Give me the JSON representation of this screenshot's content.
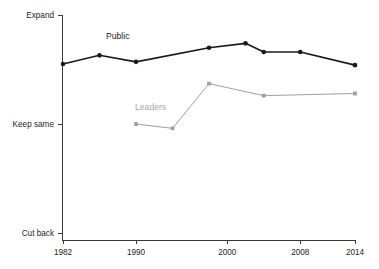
{
  "chart_data": {
    "type": "line",
    "title": "",
    "subtitle": "",
    "xlabel": "",
    "ylabel": "",
    "x_ticks": [
      1982,
      1990,
      2000,
      2008,
      2014
    ],
    "x_tick_labels": [
      "1982",
      "1990",
      "2000",
      "2008",
      "2014"
    ],
    "xlim": [
      1981,
      2015
    ],
    "y_ticks": [
      0,
      1,
      2
    ],
    "y_tick_labels": [
      "Cut back",
      "Keep same",
      "Expand"
    ],
    "ylim": [
      0,
      2
    ],
    "grid": false,
    "legend": "inline-labels",
    "series": [
      {
        "name": "Public",
        "color": "#1a1a1a",
        "label_color": "#1a1a1a",
        "label_x": 1988.0,
        "label_y": 1.78,
        "x": [
          1982,
          1986,
          1990,
          1998,
          2002,
          2004,
          2008,
          2014
        ],
        "y": [
          1.55,
          1.63,
          1.57,
          1.7,
          1.74,
          1.66,
          1.66,
          1.54
        ],
        "points": [
          {
            "x": 1982,
            "y": 1.55
          },
          {
            "x": 1986,
            "y": 1.63
          },
          {
            "x": 1990,
            "y": 1.57
          },
          {
            "x": 1998,
            "y": 1.7
          },
          {
            "x": 2002,
            "y": 1.74
          },
          {
            "x": 2004,
            "y": 1.66
          },
          {
            "x": 2008,
            "y": 1.66
          },
          {
            "x": 2014,
            "y": 1.54
          }
        ]
      },
      {
        "name": "Leaders",
        "color": "#a0a0a0",
        "label_color": "#a8a8a8",
        "label_x": 1991.6,
        "label_y": 1.13,
        "x": [
          1990,
          1994,
          1998,
          2004,
          2014
        ],
        "y": [
          1.0,
          0.96,
          1.37,
          1.26,
          1.28
        ],
        "points": [
          {
            "x": 1990,
            "y": 1.0
          },
          {
            "x": 1994,
            "y": 0.96
          },
          {
            "x": 1998,
            "y": 1.37
          },
          {
            "x": 2004,
            "y": 1.26
          },
          {
            "x": 2014,
            "y": 1.28
          }
        ]
      }
    ]
  },
  "axes": {
    "y_axis_name": "response-axis",
    "x_axis_name": "year-axis"
  }
}
